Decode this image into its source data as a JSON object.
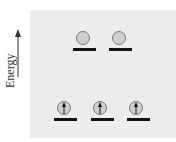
{
  "axis": {
    "label": "Energy",
    "direction": "up"
  },
  "colors": {
    "panel": "#ececec",
    "circle_fill": "#cfcfcf",
    "circle_stroke": "#777777",
    "line": "#111111"
  },
  "levels": [
    {
      "name": "upper",
      "orbitals": [
        {
          "cx": 83,
          "cy": 38,
          "line_x1": 73,
          "line_x2": 96,
          "line_y": 48,
          "electron": "empty"
        },
        {
          "cx": 119,
          "cy": 38,
          "line_x1": 109,
          "line_x2": 132,
          "line_y": 48,
          "electron": "empty"
        }
      ]
    },
    {
      "name": "lower",
      "orbitals": [
        {
          "cx": 64,
          "cy": 108,
          "line_x1": 54,
          "line_x2": 77,
          "line_y": 118,
          "electron": "spin-up"
        },
        {
          "cx": 100,
          "cy": 108,
          "line_x1": 91,
          "line_x2": 114,
          "line_y": 118,
          "electron": "spin-up"
        },
        {
          "cx": 136,
          "cy": 108,
          "line_x1": 127,
          "line_x2": 150,
          "line_y": 118,
          "electron": "spin-up"
        }
      ]
    }
  ]
}
